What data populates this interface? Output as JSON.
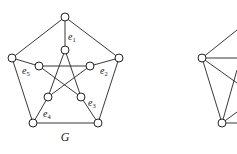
{
  "figure": {
    "graphs": [
      {
        "id": "G",
        "caption": "G",
        "description": "Petersen graph",
        "vertices": [
          {
            "id": "o1",
            "x": 65,
            "y": 17
          },
          {
            "id": "o2",
            "x": 119,
            "y": 58
          },
          {
            "id": "o3",
            "x": 98,
            "y": 123
          },
          {
            "id": "o4",
            "x": 33,
            "y": 123
          },
          {
            "id": "o5",
            "x": 12,
            "y": 58
          },
          {
            "id": "i1",
            "x": 65,
            "y": 50
          },
          {
            "id": "i2",
            "x": 90,
            "y": 66
          },
          {
            "id": "i3",
            "x": 81,
            "y": 97
          },
          {
            "id": "i4",
            "x": 48,
            "y": 97
          },
          {
            "id": "i5",
            "x": 39,
            "y": 66
          }
        ],
        "edges": [
          [
            "o1",
            "o2"
          ],
          [
            "o2",
            "o3"
          ],
          [
            "o3",
            "o4"
          ],
          [
            "o4",
            "o5"
          ],
          [
            "o5",
            "o1"
          ],
          [
            "o1",
            "i1"
          ],
          [
            "o2",
            "i2"
          ],
          [
            "o3",
            "i3"
          ],
          [
            "o4",
            "i4"
          ],
          [
            "o5",
            "i5"
          ],
          [
            "i1",
            "i3"
          ],
          [
            "i3",
            "i5"
          ],
          [
            "i5",
            "i2"
          ],
          [
            "i2",
            "i4"
          ],
          [
            "i4",
            "i1"
          ]
        ],
        "edge_labels": [
          {
            "text": "e",
            "sub": "1",
            "x": 68,
            "y": 40
          },
          {
            "text": "e",
            "sub": "2",
            "x": 100,
            "y": 74
          },
          {
            "text": "e",
            "sub": "3",
            "x": 88,
            "y": 106
          },
          {
            "text": "e",
            "sub": "4",
            "x": 43,
            "y": 117
          },
          {
            "text": "e",
            "sub": "5",
            "x": 22,
            "y": 74
          }
        ]
      },
      {
        "id": "partial-right",
        "caption": "",
        "vertices": [
          {
            "id": "a",
            "x": 202,
            "y": 58
          },
          {
            "id": "b",
            "x": 222,
            "y": 123
          }
        ],
        "edges_to_offscreen": [
          {
            "from": "a",
            "to": [
              237,
              30
            ]
          },
          {
            "from": "a",
            "to": [
              237,
              58
            ]
          },
          {
            "from": "a",
            "to": [
              237,
              83
            ]
          },
          {
            "from": "b",
            "to": [
              237,
              70
            ]
          },
          {
            "from": "b",
            "to": [
              237,
              112
            ]
          },
          {
            "from": "b",
            "to": [
              237,
              123
            ]
          }
        ],
        "edges": [
          [
            "a",
            "b"
          ]
        ]
      }
    ]
  }
}
